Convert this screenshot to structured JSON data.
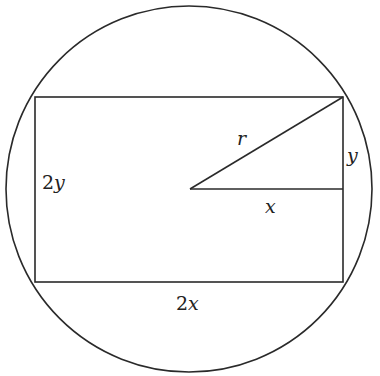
{
  "diagram": {
    "stroke_color": "#2a2a2a",
    "circle": {
      "cx": 189,
      "cy": 189,
      "r": 183
    },
    "rectangle": {
      "x": 35,
      "y": 97,
      "width": 308,
      "height": 185
    },
    "triangle": {
      "center": [
        190,
        189
      ],
      "corner": [
        343,
        97
      ],
      "foot": [
        343,
        189
      ]
    },
    "labels": {
      "hypotenuse": {
        "coef": "",
        "var": "r"
      },
      "triangle_vertical": {
        "coef": "",
        "var": "y"
      },
      "triangle_horizontal": {
        "coef": "",
        "var": "x"
      },
      "rect_height": {
        "coef": "2",
        "var": "y"
      },
      "rect_width": {
        "coef": "2",
        "var": "x"
      }
    }
  }
}
